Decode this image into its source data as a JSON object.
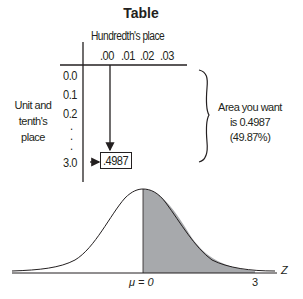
{
  "title": "Table",
  "table": {
    "column_header_label": "Hundredth's place",
    "columns": [
      ".00",
      ".01",
      ".02",
      ".03"
    ],
    "row_header_label": [
      "Unit and",
      "tenth's",
      "place"
    ],
    "rows": [
      "0.0",
      "0.1",
      "0.2",
      ".",
      ".",
      ".",
      "3.0"
    ],
    "lookup_value": ".4987"
  },
  "annotation": {
    "lines": [
      "Area you want",
      "is 0.4987",
      "(49.87%)"
    ]
  },
  "curve": {
    "mean_label": "μ = 0",
    "z_value_label": "3",
    "axis_label": "Z",
    "shade_color": "#a7a9ac"
  }
}
